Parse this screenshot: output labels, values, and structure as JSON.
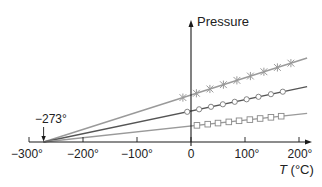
{
  "chart_data": {
    "type": "line",
    "title": "",
    "xlabel": "T (°C)",
    "ylabel": "Pressure",
    "xlim": [
      -300,
      200
    ],
    "x_ticks": [
      -300,
      -200,
      -100,
      0,
      100,
      200
    ],
    "x_tick_labels": [
      "−300°",
      "−200°",
      "−100°",
      "0",
      "100°",
      "200°"
    ],
    "grid": false,
    "legend": null,
    "annotations": [
      {
        "text": "−273°",
        "x": -273,
        "y": 0,
        "arrow": true
      }
    ],
    "series": [
      {
        "name": "gas 1 (×)",
        "marker": "x",
        "color": "#9a9a9a",
        "line_from": [
          -273,
          0
        ],
        "line_to": [
          215,
          84
        ],
        "pressure_at_0C": 47,
        "points_x": [
          -15,
          10,
          35,
          60,
          85,
          110,
          135,
          160,
          185
        ]
      },
      {
        "name": "gas 2 (○)",
        "marker": "o",
        "color": "#555555",
        "line_from": [
          -273,
          0
        ],
        "line_to": [
          215,
          56
        ],
        "pressure_at_0C": 31,
        "points_x": [
          -7,
          15,
          37,
          59,
          81,
          103,
          125,
          148,
          170
        ]
      },
      {
        "name": "gas 3 (□)",
        "marker": "s",
        "color": "#9a9a9a",
        "line_from": [
          -273,
          0
        ],
        "line_to": [
          215,
          29
        ],
        "pressure_at_0C": 16,
        "points_x": [
          11,
          31,
          50,
          70,
          89,
          109,
          128,
          148,
          167
        ]
      }
    ]
  },
  "labels": {
    "y_axis": "Pressure",
    "x_axis": "T (°C)",
    "x_axis_T": "T",
    "x_axis_unit": " (°C)",
    "annotation": "−273°",
    "ticks": [
      "−300°",
      "−200°",
      "−100°",
      "0",
      "100°",
      "200°"
    ]
  }
}
